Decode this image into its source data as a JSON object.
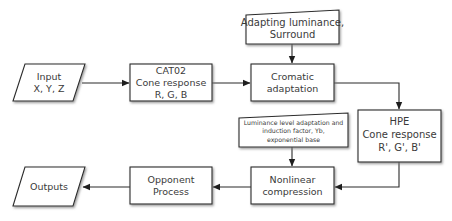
{
  "diagram": {
    "type": "flowchart",
    "colors": {
      "stroke": "#2b2b2b",
      "fill": "#ffffff",
      "shadow": "#9a9a9a",
      "text": "#3a3a3a"
    },
    "nodes": {
      "input": {
        "shape": "parallelogram",
        "lines": [
          "Input",
          "X, Y, Z"
        ]
      },
      "cat02": {
        "shape": "rectangle",
        "lines": [
          "CAT02",
          "Cone response",
          "R, G, B"
        ]
      },
      "adapting": {
        "shape": "manual-input",
        "lines": [
          "Adapting luminance,",
          "Surround"
        ]
      },
      "cromatic": {
        "shape": "rectangle",
        "lines": [
          "Cromatic",
          "adaptation"
        ]
      },
      "hpe": {
        "shape": "rectangle",
        "lines": [
          "HPE",
          "Cone response",
          "R', G', B'"
        ]
      },
      "luminance": {
        "shape": "manual-input",
        "lines": [
          "Luminance level adaptation and",
          "induction factor, Yb,",
          "exponential base"
        ]
      },
      "nonlinear": {
        "shape": "rectangle",
        "lines": [
          "Nonlinear",
          "compression"
        ]
      },
      "opponent": {
        "shape": "rectangle",
        "lines": [
          "Opponent",
          "Process"
        ]
      },
      "outputs": {
        "shape": "parallelogram",
        "lines": [
          "Outputs"
        ]
      }
    },
    "edges": [
      {
        "from": "input",
        "to": "cat02"
      },
      {
        "from": "cat02",
        "to": "cromatic"
      },
      {
        "from": "adapting",
        "to": "cromatic"
      },
      {
        "from": "cromatic",
        "to": "hpe"
      },
      {
        "from": "hpe",
        "to": "nonlinear"
      },
      {
        "from": "luminance",
        "to": "nonlinear"
      },
      {
        "from": "nonlinear",
        "to": "opponent"
      },
      {
        "from": "opponent",
        "to": "outputs"
      }
    ]
  }
}
